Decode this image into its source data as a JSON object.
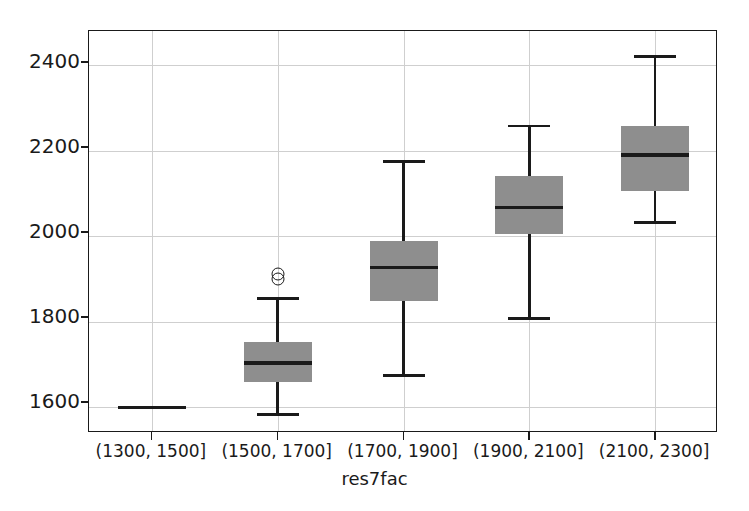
{
  "chart_data": {
    "type": "box",
    "title": "",
    "xlabel": "res7fac",
    "ylabel": "",
    "categories": [
      "(1300, 1500]",
      "(1500, 1700]",
      "(1700, 1900]",
      "(1900, 2100]",
      "(2100, 2300]"
    ],
    "ylim": [
      1540,
      2480
    ],
    "yticks": [
      1600,
      1800,
      2000,
      2200,
      2400
    ],
    "ytick_labels": [
      "1600",
      "1800",
      "2000",
      "2200",
      "2400"
    ],
    "grid": "both",
    "legend": "none",
    "box_color": "#8e8e8e",
    "line_color": "#1a1a1a",
    "boxes": [
      {
        "category": "(1300, 1500]",
        "whisker_low": 1600,
        "q1": 1600,
        "median": 1600,
        "q3": 1600,
        "whisker_high": 1600,
        "fliers": []
      },
      {
        "category": "(1500, 1700]",
        "whisker_low": 1583,
        "q1": 1660,
        "median": 1704,
        "q3": 1753,
        "whisker_high": 1854,
        "fliers": [
          1912,
          1900
        ]
      },
      {
        "category": "(1700, 1900]",
        "whisker_low": 1674,
        "q1": 1849,
        "median": 1927,
        "q3": 1989,
        "whisker_high": 2175,
        "fliers": []
      },
      {
        "category": "(1900, 2100]",
        "whisker_low": 1808,
        "q1": 2005,
        "median": 2067,
        "q3": 2140,
        "whisker_high": 2258,
        "fliers": []
      },
      {
        "category": "(2100, 2300]",
        "whisker_low": 2032,
        "q1": 2106,
        "median": 2190,
        "q3": 2258,
        "whisker_high": 2420,
        "fliers": []
      }
    ]
  },
  "axis": {
    "x_label": "res7fac",
    "y_tick_labels": [
      "2400",
      "2200",
      "2000",
      "1800",
      "1600"
    ],
    "x_tick_labels": [
      "(1300, 1500]",
      "(1500, 1700]",
      "(1700, 1900]",
      "(1900, 2100]",
      "(2100, 2300]"
    ]
  }
}
